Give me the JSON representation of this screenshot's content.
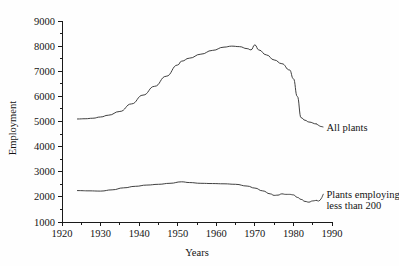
{
  "chart_data": {
    "type": "line",
    "title": "",
    "xlabel": "Years",
    "ylabel": "Employment",
    "xlim": [
      1920,
      1990
    ],
    "ylim": [
      1000,
      9000
    ],
    "grid": false,
    "legend_position": "inline-right",
    "x_ticks": [
      1920,
      1930,
      1940,
      1950,
      1960,
      1970,
      1980,
      1990
    ],
    "x_tick_labels": [
      "1920",
      "1930",
      "1940",
      "1950",
      "1960",
      "1970",
      "1980",
      "1990"
    ],
    "x_minor_ticks": [
      1925,
      1935,
      1945,
      1955,
      1965,
      1975,
      1985
    ],
    "y_ticks": [
      1000,
      2000,
      3000,
      4000,
      5000,
      6000,
      7000,
      8000,
      9000
    ],
    "y_tick_labels": [
      "1000",
      "2000",
      "3000",
      "4000",
      "5000",
      "6000",
      "7000",
      "8000",
      "9000"
    ],
    "y_minor_ticks": [
      1500,
      2500,
      3500,
      4500,
      5500,
      6500,
      7500,
      8500
    ],
    "series": [
      {
        "name": "All plants",
        "label": "All plants",
        "x": [
          1924,
          1926,
          1928,
          1930,
          1932,
          1935,
          1938,
          1941,
          1944,
          1947,
          1950,
          1951,
          1953,
          1956,
          1959,
          1962,
          1964,
          1966,
          1968,
          1969,
          1970,
          1971,
          1973,
          1975,
          1977,
          1979,
          1980,
          1981,
          1982,
          1983,
          1984,
          1986
        ],
        "values": [
          5100,
          5110,
          5130,
          5180,
          5250,
          5400,
          5700,
          6050,
          6400,
          6800,
          7250,
          7400,
          7520,
          7680,
          7830,
          7960,
          8000,
          7980,
          7900,
          7850,
          8050,
          7850,
          7650,
          7450,
          7300,
          7050,
          6700,
          6000,
          5150,
          5050,
          4980,
          4900
        ],
        "label_x": 1987,
        "label_y": 4780
      },
      {
        "name": "Plants employing less than 200",
        "label_line1": "Plants employing",
        "label_line2": "less than 200",
        "x": [
          1924,
          1927,
          1930,
          1933,
          1936,
          1939,
          1942,
          1945,
          1948,
          1951,
          1953,
          1956,
          1959,
          1962,
          1965,
          1968,
          1970,
          1972,
          1974,
          1975,
          1976,
          1977,
          1978,
          1979,
          1980,
          1981,
          1982,
          1983,
          1984,
          1985,
          1986
        ],
        "values": [
          2250,
          2240,
          2230,
          2280,
          2360,
          2420,
          2470,
          2500,
          2540,
          2600,
          2570,
          2540,
          2530,
          2520,
          2500,
          2430,
          2350,
          2240,
          2120,
          2060,
          2070,
          2120,
          2100,
          2100,
          2080,
          1980,
          1900,
          1820,
          1790,
          1840,
          1860
        ],
        "label_x": 1987,
        "label_y": 2120
      }
    ]
  },
  "axes": {
    "y_axis_title": "Employment",
    "x_axis_title": "Years"
  },
  "colors": {
    "line": "#2a2a2a",
    "axis": "#1a1a1a",
    "background": "#ffffff",
    "text": "#141414"
  }
}
